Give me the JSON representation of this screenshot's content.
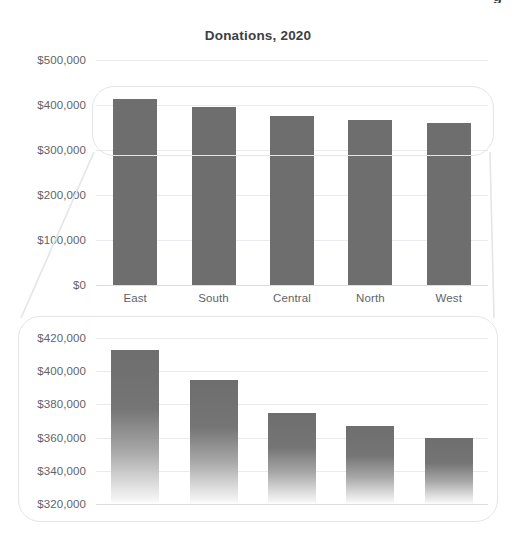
{
  "page": {
    "cut_off_top_text": "g",
    "background": "#ffffff",
    "bar_color": "#6e6e6e",
    "grid_color": "#e8eaed",
    "text_color": "#5f6368",
    "title_color": "#3c4043",
    "callout_border_color": "#e3e5e8"
  },
  "chart_data": [
    {
      "id": "overview",
      "type": "bar",
      "title": "Donations, 2020",
      "xlabel": "",
      "ylabel": "",
      "categories": [
        "East",
        "South",
        "Central",
        "North",
        "West"
      ],
      "values": [
        413000,
        395000,
        375000,
        367000,
        360000
      ],
      "ylim": [
        0,
        500000
      ],
      "yticks": [
        0,
        100000,
        200000,
        300000,
        400000,
        500000
      ],
      "ytick_labels": [
        "$0",
        "$100,000",
        "$200,000",
        "$300,000",
        "$400,000",
        "$500,000"
      ],
      "grid": true,
      "legend": "none"
    },
    {
      "id": "magnified",
      "type": "bar",
      "title": "",
      "xlabel": "",
      "ylabel": "",
      "categories": [
        "East",
        "South",
        "Central",
        "North",
        "West"
      ],
      "values": [
        413000,
        395000,
        375000,
        367000,
        360000
      ],
      "ylim": [
        320000,
        420000
      ],
      "yticks": [
        320000,
        340000,
        360000,
        380000,
        400000,
        420000
      ],
      "ytick_labels": [
        "$320,000",
        "$340,000",
        "$360,000",
        "$380,000",
        "$400,000",
        "$420,000"
      ],
      "grid": true,
      "legend": "none",
      "note": "magnified detail view of the $300,000-$420,000 band of the overview chart"
    }
  ]
}
